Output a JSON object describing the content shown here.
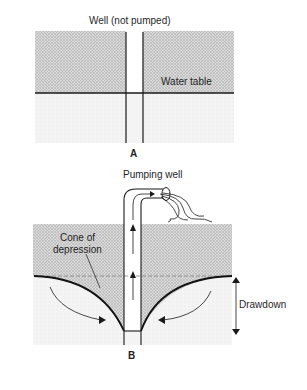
{
  "figure": {
    "panel_a": {
      "title": "Well (not pumped)",
      "water_table_label": "Water table",
      "panel_label": "A"
    },
    "panel_b": {
      "title": "Pumping well",
      "cone_label_line1": "Cone of",
      "cone_label_line2": "depression",
      "drawdown_label": "Drawdown",
      "panel_label": "B"
    },
    "colors": {
      "stipple_zone": "#cfcfcf",
      "saturated_zone": "#f3f3f3",
      "line": "#1a1a1a",
      "background": "#ffffff"
    }
  }
}
